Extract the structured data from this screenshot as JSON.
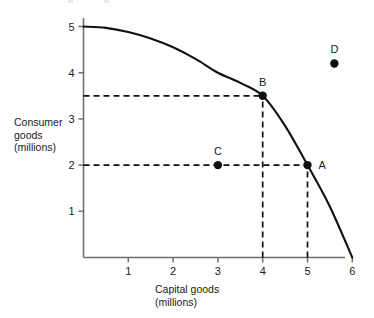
{
  "chart_data": {
    "type": "line",
    "title": "",
    "subtitle": "",
    "xlabel": "Capital goods",
    "xlabel_units": "(millions)",
    "ylabel": "Consumer",
    "ylabel_line2": "goods",
    "ylabel_units": "(millions)",
    "xlim": [
      0,
      6.3
    ],
    "ylim": [
      0,
      5.4
    ],
    "xticks": [
      1,
      2,
      3,
      4,
      5,
      6
    ],
    "xtick_labels": [
      "1",
      "2",
      "3",
      "4",
      "5",
      "6"
    ],
    "yticks": [
      1,
      2,
      3,
      4,
      5
    ],
    "ytick_labels": [
      "1",
      "2",
      "3",
      "4",
      "5"
    ],
    "grid": false,
    "legend": false,
    "series": [
      {
        "name": "production possibility frontier",
        "type": "line",
        "style": "solid",
        "color": "#101010",
        "points": [
          {
            "x": 0.0,
            "y": 5.0
          },
          {
            "x": 0.5,
            "y": 4.97
          },
          {
            "x": 1.0,
            "y": 4.88
          },
          {
            "x": 1.5,
            "y": 4.74
          },
          {
            "x": 2.0,
            "y": 4.55
          },
          {
            "x": 2.5,
            "y": 4.3
          },
          {
            "x": 3.0,
            "y": 4.0
          },
          {
            "x": 3.5,
            "y": 3.78
          },
          {
            "x": 4.0,
            "y": 3.5
          },
          {
            "x": 4.5,
            "y": 2.85
          },
          {
            "x": 5.0,
            "y": 2.0
          },
          {
            "x": 5.5,
            "y": 1.1
          },
          {
            "x": 6.0,
            "y": 0.0
          }
        ]
      }
    ],
    "annotated_points": [
      {
        "label": "A",
        "x": 5.0,
        "y": 2.0,
        "label_position": "right",
        "on_curve": true
      },
      {
        "label": "B",
        "x": 4.0,
        "y": 3.5,
        "label_position": "above",
        "on_curve": true
      },
      {
        "label": "C",
        "x": 3.0,
        "y": 2.0,
        "label_position": "above",
        "on_curve": false
      },
      {
        "label": "D",
        "x": 5.6,
        "y": 4.2,
        "label_position": "above",
        "on_curve": false
      }
    ],
    "guide_lines": [
      {
        "orientation": "horizontal",
        "value": 3.5,
        "from_x": 0.0,
        "to_x": 4.0,
        "style": "dashed"
      },
      {
        "orientation": "horizontal",
        "value": 2.0,
        "from_x": 0.0,
        "to_x": 5.0,
        "style": "dashed"
      },
      {
        "orientation": "vertical",
        "value": 4.0,
        "from_y": 0.0,
        "to_y": 3.5,
        "style": "dashed"
      },
      {
        "orientation": "vertical",
        "value": 5.0,
        "from_y": 0.0,
        "to_y": 2.0,
        "style": "dashed"
      }
    ],
    "colors": {
      "curve": "#101010",
      "axis": "#6e6e6e",
      "dash": "#101010",
      "point": "#101010",
      "text": "#1a1a1a",
      "background": "#ffffff"
    }
  }
}
